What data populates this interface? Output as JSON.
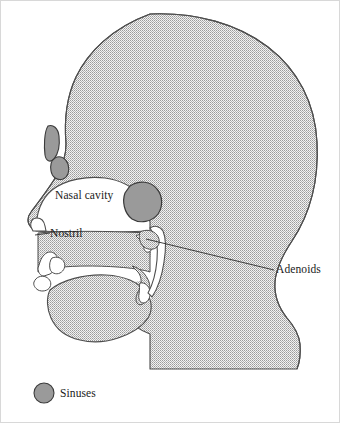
{
  "figure": {
    "background_color": "#ffffff",
    "frame_color": "#cfcfcf"
  },
  "colors": {
    "tissue_fill": "#e6e6e6",
    "tissue_stipple": "#8c8c8c",
    "outline": "#4d4d4d",
    "sinus_fill": "#9a9a9a",
    "sinus_outline": "#3a3a3a",
    "airway_fill": "#ffffff",
    "text": "#1a1a1a",
    "leader_line": "#2b2b2b"
  },
  "labels": {
    "nasal_cavity": "Nasal cavity",
    "nostril": "Nostril",
    "adenoids": "Adenoids"
  },
  "legend": {
    "swatch_shape": "circle",
    "swatch_color": "#9a9a9a",
    "label": "Sinuses"
  },
  "structures": [
    {
      "name": "head-profile",
      "kind": "tissue",
      "label": null
    },
    {
      "name": "nasal-cavity-airway",
      "kind": "airway",
      "label": "Nasal cavity"
    },
    {
      "name": "nostril-opening",
      "kind": "airway",
      "label": "Nostril"
    },
    {
      "name": "oral-cavity-airway",
      "kind": "airway",
      "label": null
    },
    {
      "name": "pharynx-airway",
      "kind": "airway",
      "label": null
    },
    {
      "name": "tongue",
      "kind": "tissue",
      "label": null
    },
    {
      "name": "soft-palate-uvula",
      "kind": "tissue",
      "label": null
    },
    {
      "name": "adenoid-mass",
      "kind": "tissue",
      "label": "Adenoids"
    },
    {
      "name": "frontal-sinus",
      "kind": "sinus",
      "label": "Sinuses"
    },
    {
      "name": "ethmoid-sinus",
      "kind": "sinus",
      "label": "Sinuses"
    },
    {
      "name": "sphenoid-sinus",
      "kind": "sinus",
      "label": "Sinuses"
    }
  ]
}
